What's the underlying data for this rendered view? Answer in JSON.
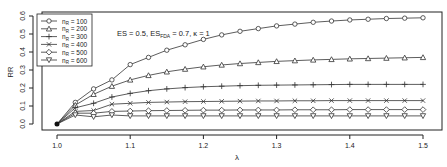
{
  "chart_data": {
    "type": "line",
    "title": "",
    "annotation": {
      "prefix": "ES = 0.5, ES",
      "sub": "FDA",
      "suffix": " = 0.7, κ = 1"
    },
    "xlabel": "λ",
    "ylabel": "RR",
    "xlim": [
      1.0,
      1.5
    ],
    "ylim": [
      0.0,
      0.6
    ],
    "xticks": [
      "1.0",
      "1.1",
      "1.2",
      "1.3",
      "1.4",
      "1.5"
    ],
    "yticks": [
      "0.0",
      "0.1",
      "0.2",
      "0.3",
      "0.4",
      "0.5",
      "0.6"
    ],
    "grid": false,
    "legend_position": "top-left",
    "x": [
      1.0,
      1.025,
      1.05,
      1.075,
      1.1,
      1.125,
      1.15,
      1.175,
      1.2,
      1.225,
      1.25,
      1.275,
      1.3,
      1.325,
      1.35,
      1.375,
      1.4,
      1.425,
      1.45,
      1.475,
      1.5
    ],
    "series": [
      {
        "name": "n_R = 100",
        "label_n": "n",
        "label_sub": "R",
        "label_val": " = 100",
        "marker": "circle",
        "values": [
          0.0,
          0.12,
          0.195,
          0.245,
          0.33,
          0.37,
          0.41,
          0.44,
          0.47,
          0.495,
          0.515,
          0.53,
          0.545,
          0.555,
          0.565,
          0.572,
          0.578,
          0.582,
          0.586,
          0.588,
          0.59
        ]
      },
      {
        "name": "n_R = 200",
        "label_n": "n",
        "label_sub": "R",
        "label_val": " = 200",
        "marker": "triangle",
        "values": [
          0.0,
          0.105,
          0.165,
          0.21,
          0.245,
          0.27,
          0.29,
          0.305,
          0.318,
          0.328,
          0.336,
          0.342,
          0.348,
          0.352,
          0.356,
          0.359,
          0.362,
          0.364,
          0.366,
          0.368,
          0.37
        ]
      },
      {
        "name": "n_R = 300",
        "label_n": "n",
        "label_sub": "R",
        "label_val": " = 300",
        "marker": "plus",
        "values": [
          0.0,
          0.09,
          0.115,
          0.15,
          0.17,
          0.185,
          0.195,
          0.202,
          0.207,
          0.21,
          0.213,
          0.215,
          0.216,
          0.217,
          0.218,
          0.219,
          0.22,
          0.22,
          0.22,
          0.22,
          0.22
        ]
      },
      {
        "name": "n_R = 400",
        "label_n": "n",
        "label_sub": "R",
        "label_val": " = 400",
        "marker": "x",
        "values": [
          0.0,
          0.07,
          0.075,
          0.11,
          0.115,
          0.12,
          0.122,
          0.124,
          0.125,
          0.126,
          0.127,
          0.128,
          0.128,
          0.129,
          0.129,
          0.13,
          0.13,
          0.13,
          0.13,
          0.13,
          0.13
        ]
      },
      {
        "name": "n_R = 500",
        "label_n": "n",
        "label_sub": "R",
        "label_val": " = 500",
        "marker": "diamond",
        "values": [
          0.0,
          0.06,
          0.06,
          0.07,
          0.072,
          0.074,
          0.075,
          0.076,
          0.077,
          0.077,
          0.078,
          0.078,
          0.078,
          0.079,
          0.079,
          0.079,
          0.08,
          0.08,
          0.08,
          0.08,
          0.08
        ]
      },
      {
        "name": "n_R = 600",
        "label_n": "n",
        "label_sub": "R",
        "label_val": " = 600",
        "marker": "nabla",
        "values": [
          0.0,
          0.05,
          0.04,
          0.05,
          0.045,
          0.045,
          0.045,
          0.045,
          0.045,
          0.045,
          0.045,
          0.045,
          0.045,
          0.045,
          0.045,
          0.045,
          0.045,
          0.045,
          0.045,
          0.045,
          0.045
        ]
      }
    ],
    "colors": {
      "line": "#333333",
      "axis": "#222222",
      "background": "#ffffff"
    }
  }
}
